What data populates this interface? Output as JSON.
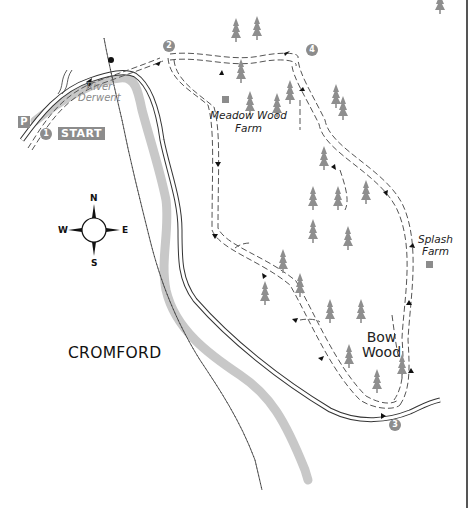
{
  "map": {
    "title": "Cromford walk route map",
    "colors": {
      "river": "#c8c8c8",
      "trees": "#8e8e8e",
      "route": "#555555",
      "badge": "#8c8c8c",
      "road": "#333333"
    },
    "labels": {
      "river": "River Derwent",
      "river_line1": "River",
      "river_line2": "Derwent",
      "start": "START",
      "parking": "P",
      "town": "CROMFORD",
      "meadow_farm_line1": "Meadow Wood",
      "meadow_farm_line2": "Farm",
      "splash_farm_line1": "Splash",
      "splash_farm_line2": "Farm",
      "wood_line1": "Bow",
      "wood_line2": "Wood"
    },
    "waypoints": [
      {
        "number": "1",
        "label": "1"
      },
      {
        "number": "2",
        "label": "2"
      },
      {
        "number": "3",
        "label": "3"
      },
      {
        "number": "4",
        "label": "4"
      }
    ],
    "compass": {
      "north": "N",
      "south": "S",
      "east": "E",
      "west": "W"
    },
    "icons": [
      "parking-icon",
      "compass-rose-icon",
      "tree-icon",
      "farm-building-icon",
      "route-arrow-icon",
      "railway-icon"
    ]
  }
}
